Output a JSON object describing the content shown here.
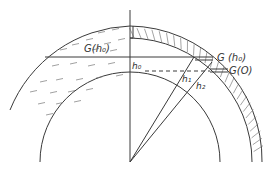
{
  "diagram": {
    "labels": {
      "g_h0_left": "G(h₀)",
      "g_h0_right": "G (h₀)",
      "g_0": "G(O)",
      "h0": "h₀",
      "h1": "h₁",
      "h2": "h₂"
    },
    "colors": {
      "line": "#3a3a3a",
      "hatch": "#666666",
      "background": "#ffffff"
    }
  }
}
